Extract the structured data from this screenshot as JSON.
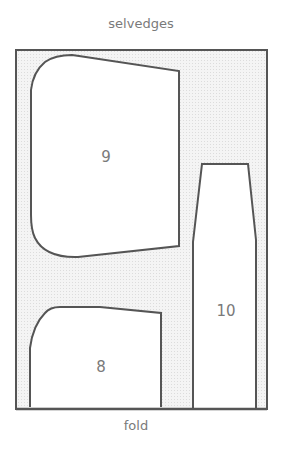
{
  "diagram": {
    "top_edge_label": "selvedges",
    "bottom_edge_label": "fold",
    "pieces": [
      {
        "id": "9",
        "label": "9"
      },
      {
        "id": "8",
        "label": "8"
      },
      {
        "id": "10",
        "label": "10"
      }
    ],
    "colors": {
      "outline": "#555555",
      "fabric_background": "#eeeeee",
      "piece_fill": "#ffffff",
      "text": "#7a7a7a"
    }
  }
}
